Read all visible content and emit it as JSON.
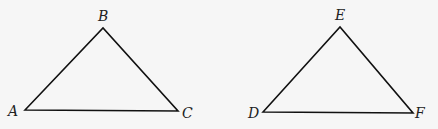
{
  "diagram": {
    "triangles": [
      {
        "name": "triangle-abc",
        "vertices": [
          {
            "label": "A",
            "x": 25,
            "y": 110,
            "lx": 8,
            "ly": 116
          },
          {
            "label": "B",
            "x": 103,
            "y": 28,
            "lx": 98,
            "ly": 21
          },
          {
            "label": "C",
            "x": 178,
            "y": 111,
            "lx": 182,
            "ly": 118
          }
        ]
      },
      {
        "name": "triangle-def",
        "vertices": [
          {
            "label": "D",
            "x": 263,
            "y": 112,
            "lx": 248,
            "ly": 118
          },
          {
            "label": "E",
            "x": 340,
            "y": 27,
            "lx": 335,
            "ly": 20
          },
          {
            "label": "F",
            "x": 413,
            "y": 113,
            "lx": 415,
            "ly": 118
          }
        ]
      }
    ],
    "colors": {
      "stroke": "#111111",
      "background": "#f6f6f6",
      "label": "#222222"
    }
  }
}
